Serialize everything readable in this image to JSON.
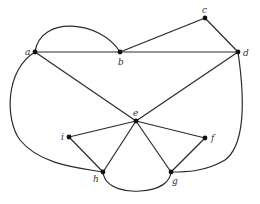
{
  "diagram": {
    "type": "graph",
    "nodes": [
      {
        "id": "a",
        "label": "a",
        "x": 35,
        "y": 52,
        "lx": 25,
        "ly": 55
      },
      {
        "id": "b",
        "label": "b",
        "x": 120,
        "y": 52,
        "lx": 118,
        "ly": 65
      },
      {
        "id": "c",
        "label": "c",
        "x": 205,
        "y": 18,
        "lx": 202,
        "ly": 13
      },
      {
        "id": "d",
        "label": "d",
        "x": 238,
        "y": 52,
        "lx": 243,
        "ly": 56
      },
      {
        "id": "e",
        "label": "e",
        "x": 136,
        "y": 121,
        "lx": 133,
        "ly": 116
      },
      {
        "id": "i",
        "label": "i",
        "x": 69,
        "y": 137,
        "lx": 61,
        "ly": 140
      },
      {
        "id": "f",
        "label": "f",
        "x": 205,
        "y": 138,
        "lx": 211,
        "ly": 141
      },
      {
        "id": "h",
        "label": "h",
        "x": 103,
        "y": 172,
        "lx": 93,
        "ly": 182
      },
      {
        "id": "g",
        "label": "g",
        "x": 171,
        "y": 172,
        "lx": 172,
        "ly": 184
      }
    ],
    "edges": [
      {
        "from": "a",
        "to": "b",
        "shape": "straight"
      },
      {
        "from": "b",
        "to": "d",
        "shape": "straight"
      },
      {
        "from": "b",
        "to": "c",
        "shape": "straight"
      },
      {
        "from": "c",
        "to": "d",
        "shape": "straight"
      },
      {
        "from": "a",
        "to": "e",
        "shape": "straight"
      },
      {
        "from": "d",
        "to": "e",
        "shape": "straight"
      },
      {
        "from": "e",
        "to": "i",
        "shape": "straight"
      },
      {
        "from": "e",
        "to": "f",
        "shape": "straight"
      },
      {
        "from": "e",
        "to": "h",
        "shape": "straight"
      },
      {
        "from": "e",
        "to": "g",
        "shape": "straight"
      },
      {
        "from": "i",
        "to": "h",
        "shape": "straight"
      },
      {
        "from": "f",
        "to": "g",
        "shape": "straight"
      },
      {
        "from": "a",
        "to": "b",
        "shape": "curved-top"
      },
      {
        "from": "a",
        "to": "h",
        "shape": "curved-left"
      },
      {
        "from": "d",
        "to": "g",
        "shape": "curved-right"
      },
      {
        "from": "h",
        "to": "g",
        "shape": "curved-bottom"
      }
    ],
    "curves": {
      "a_b_top": "M35,52 C40,15 100,20 120,52",
      "a_h_left": "M35,52 C5,70 5,120 20,140 C40,165 80,168 103,172",
      "d_g_right": "M238,52 C245,100 245,145 225,160 C205,172 185,172 171,172",
      "h_g_bottom": "M103,172 C105,190 130,192 140,191 C160,190 170,182 171,172"
    }
  }
}
